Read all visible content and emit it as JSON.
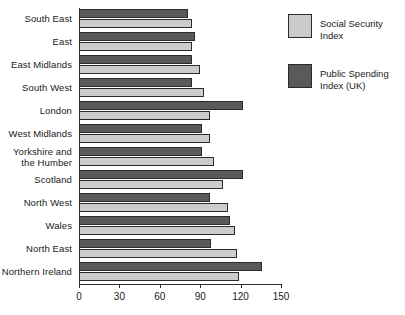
{
  "chart_data": {
    "type": "bar",
    "orientation": "horizontal",
    "title": "",
    "xlabel": "",
    "ylabel": "",
    "xlim": [
      0,
      150
    ],
    "xticks": [
      0,
      30,
      60,
      90,
      120,
      150
    ],
    "xtick_labels": [
      "0",
      "30",
      "60",
      "90",
      "120",
      "150"
    ],
    "grid": false,
    "legend_position": "right",
    "categories": [
      "South East",
      "East",
      "East Midlands",
      "South West",
      "London",
      "West Midlands",
      "Yorkshire and\nthe Humber",
      "Scotland",
      "North West",
      "Wales",
      "North East",
      "Northern Ireland"
    ],
    "series": [
      {
        "name": "Public Spending Index (UK)",
        "color": "#5a5a5a",
        "values": [
          81,
          86,
          84,
          84,
          122,
          91,
          91,
          122,
          97,
          112,
          98,
          136
        ]
      },
      {
        "name": "Social Security Index",
        "color": "#cccccc",
        "values": [
          84,
          84,
          90,
          93,
          97,
          97,
          100,
          107,
          111,
          116,
          117,
          119
        ]
      }
    ]
  },
  "legend": {
    "entries": [
      {
        "label": "Social Security Index",
        "color": "#cccccc"
      },
      {
        "label": "Public Spending\nIndex (UK)",
        "color": "#5a5a5a"
      }
    ]
  },
  "colors": {
    "dark_bar": "#5a5a5a",
    "light_bar": "#cccccc",
    "outline": "#2b2b2b",
    "background": "#ffffff"
  }
}
